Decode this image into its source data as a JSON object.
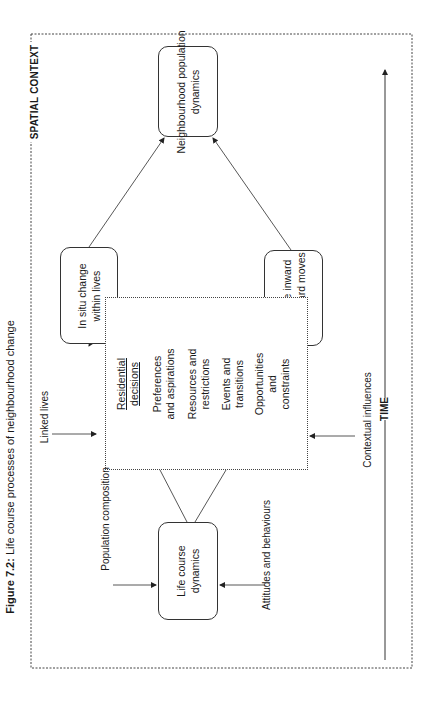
{
  "figure": {
    "caption_label": "Figure 7.2:",
    "caption_text": " Life course processes of neighbourhood change"
  },
  "frame": {
    "label": "SPATIAL CONTEXT"
  },
  "time_axis": {
    "label": "TIME"
  },
  "nodes": {
    "life_course": [
      "Life course",
      "dynamics"
    ],
    "in_situ": [
      "In situ change",
      "within lives"
    ],
    "selective": [
      "Selective inward",
      "and outward moves"
    ],
    "neighbourhood": [
      "Neighbourhood population",
      "dynamics"
    ]
  },
  "decisions": {
    "heading": [
      "Residential",
      "decisions"
    ],
    "items": [
      [
        "Preferences",
        "and aspirations"
      ],
      [
        "Resources and",
        "restrictions"
      ],
      [
        "Events and",
        "transitions"
      ],
      [
        "Opportunities",
        "and",
        "constraints"
      ]
    ]
  },
  "influences": {
    "linked_lives": "Linked lives",
    "population_composition": "Population composition",
    "attitudes": "Attitudes and behaviours",
    "contextual": "Contextual influences"
  }
}
